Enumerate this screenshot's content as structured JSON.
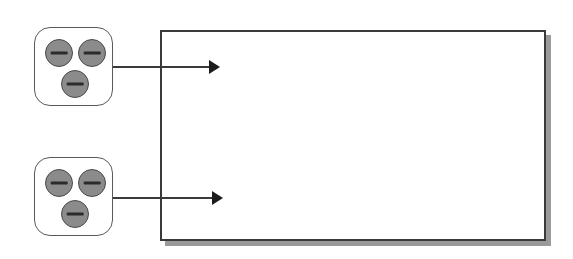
{
  "diagram": {
    "background_color": "#ffffff",
    "panel": {
      "label": "",
      "fill_color": "#ffffff",
      "border_color": "#3a3a3a",
      "shadow_color": "#9a9a9a",
      "x": 160,
      "y": 30,
      "width": 386,
      "height": 211,
      "shadow_offset_x": 5,
      "shadow_offset_y": 5
    },
    "devices": [
      {
        "name": "device-unit-top",
        "label": "",
        "x": 34,
        "y": 27,
        "width": 79,
        "height": 79,
        "fill_color": "#ffffff",
        "border_color": "#5a5a5a",
        "knobs": [
          {
            "name": "knob-top-left",
            "label": "",
            "x": 10,
            "y": 11,
            "size": 28
          },
          {
            "name": "knob-top-right",
            "label": "",
            "x": 43,
            "y": 11,
            "size": 28
          },
          {
            "name": "knob-bottom-center",
            "label": "",
            "x": 26,
            "y": 42,
            "size": 28
          }
        ]
      },
      {
        "name": "device-unit-bottom",
        "label": "",
        "x": 34,
        "y": 157,
        "width": 79,
        "height": 79,
        "fill_color": "#ffffff",
        "border_color": "#5a5a5a",
        "knobs": [
          {
            "name": "knob-top-left",
            "label": "",
            "x": 10,
            "y": 11,
            "size": 28
          },
          {
            "name": "knob-top-right",
            "label": "",
            "x": 43,
            "y": 11,
            "size": 28
          },
          {
            "name": "knob-bottom-center",
            "label": "",
            "x": 26,
            "y": 42,
            "size": 28
          }
        ]
      }
    ],
    "arrows": [
      {
        "name": "arrow-top",
        "label": "",
        "from": "device-unit-top",
        "to": "panel",
        "x": 113,
        "y": 67,
        "length": 96,
        "color": "#3a3a3a"
      },
      {
        "name": "arrow-bottom",
        "label": "",
        "from": "device-unit-bottom",
        "to": "panel",
        "x": 113,
        "y": 198,
        "length": 99,
        "color": "#3a3a3a"
      }
    ]
  }
}
